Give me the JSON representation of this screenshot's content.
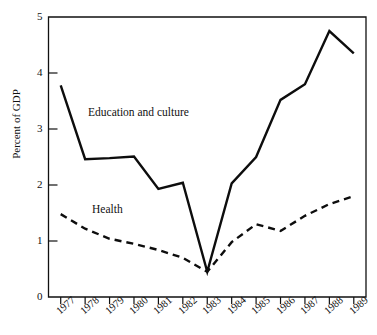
{
  "chart_data": {
    "type": "line",
    "title": "",
    "subtitle": "",
    "xlabel": "",
    "ylabel": "Percent of GDP",
    "categories": [
      "1977",
      "1978",
      "1979",
      "1980",
      "1981",
      "1982",
      "1983",
      "1984",
      "1985",
      "1986",
      "1987",
      "1988",
      "1989"
    ],
    "x": [
      1977,
      1978,
      1979,
      1980,
      1981,
      1982,
      1983,
      1984,
      1985,
      1986,
      1987,
      1988,
      1989
    ],
    "xlim": [
      1977,
      1989
    ],
    "ylim": [
      0,
      5
    ],
    "yticks": [
      0,
      1,
      2,
      3,
      4,
      5
    ],
    "ytick_labels": [
      "0",
      "1",
      "2",
      "3",
      "4",
      "5"
    ],
    "grid": false,
    "legend_position": "inline-annotation",
    "series": [
      {
        "name": "Education and culture",
        "style": "solid",
        "color": "#0d0d0d",
        "values": [
          3.78,
          2.46,
          2.48,
          2.51,
          1.93,
          2.04,
          0.45,
          2.03,
          2.5,
          3.52,
          3.8,
          4.75,
          4.35
        ]
      },
      {
        "name": "Health",
        "style": "dashed",
        "color": "#0d0d0d",
        "values": [
          1.48,
          1.22,
          1.04,
          0.95,
          0.84,
          0.7,
          0.45,
          0.98,
          1.3,
          1.18,
          1.45,
          1.66,
          1.8
        ]
      }
    ],
    "annotations": [
      {
        "text": "Education and culture",
        "x": 1979.2,
        "y": 3.2
      },
      {
        "text": "Health",
        "x": 1979.3,
        "y": 1.6
      }
    ]
  },
  "axes": {
    "y_label": "Percent of GDP",
    "y_ticks": [
      "0",
      "1",
      "2",
      "3",
      "4",
      "5"
    ],
    "x_ticks": [
      "1977",
      "1978",
      "1979",
      "1980",
      "1981",
      "1982",
      "1983",
      "1984",
      "1985",
      "1986",
      "1987",
      "1988",
      "1989"
    ]
  },
  "annotations": {
    "education": "Education and culture",
    "health": "Health"
  },
  "colors": {
    "line": "#0d0d0d",
    "axis": "#111111",
    "background": "#ffffff"
  }
}
